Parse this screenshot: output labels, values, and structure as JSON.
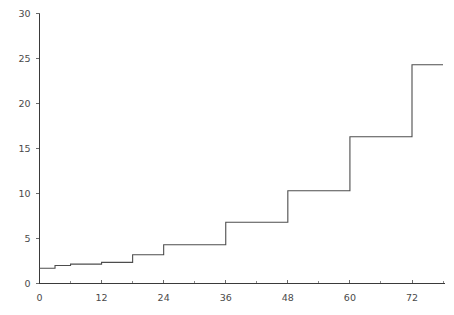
{
  "chart_data": {
    "type": "line",
    "subtype": "step",
    "title": "",
    "subtitle": "",
    "xlabel": "",
    "ylabel": "",
    "xlim": [
      0,
      78
    ],
    "ylim": [
      0,
      30
    ],
    "grid": false,
    "legend": null,
    "x_ticks": [
      0,
      12,
      24,
      36,
      48,
      60,
      72
    ],
    "x_tick_labels": [
      "0",
      "12",
      "24",
      "36",
      "48",
      "60",
      "72"
    ],
    "x_minor_ticks": [
      6,
      18,
      30,
      42,
      54,
      66,
      78
    ],
    "y_ticks": [
      0,
      5,
      10,
      15,
      20,
      25,
      30
    ],
    "y_tick_labels": [
      "0",
      "5",
      "10",
      "15",
      "20",
      "25",
      "30"
    ],
    "series": [
      {
        "name": "cumulative",
        "color": "#4d4d4d",
        "step_mode": "post",
        "x": [
          0,
          3,
          6,
          12,
          18,
          24,
          36,
          48,
          60,
          72,
          78
        ],
        "y": [
          1.7,
          2.0,
          2.15,
          2.35,
          3.2,
          4.3,
          6.8,
          10.3,
          16.3,
          24.3,
          24.3
        ]
      }
    ]
  },
  "axes": {
    "x_axis_name": "x-axis",
    "y_axis_name": "y-axis"
  }
}
